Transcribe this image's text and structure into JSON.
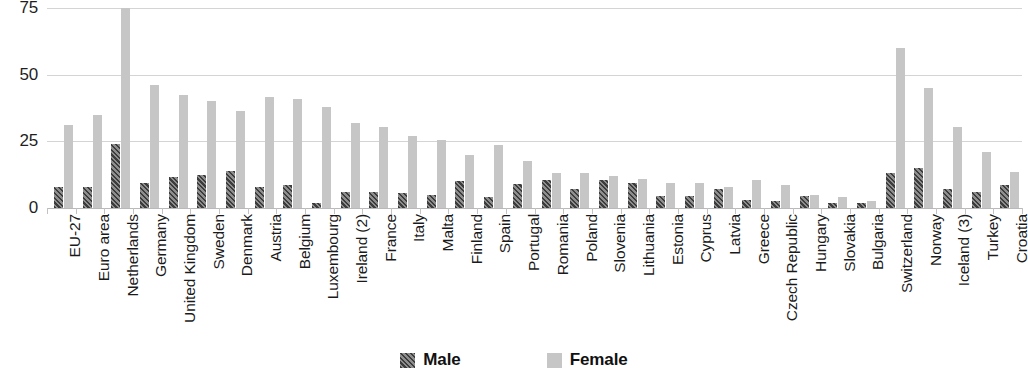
{
  "chart_data": {
    "type": "bar",
    "title": "",
    "subtitle": "",
    "xlabel": "",
    "ylabel": "",
    "ylim": [
      0,
      75
    ],
    "yticks": [
      0,
      25,
      50,
      75
    ],
    "ytick_labels": [
      "0",
      "25",
      "50",
      "75"
    ],
    "grid": true,
    "legend_position": "bottom-center",
    "categories": [
      "EU-27",
      "Euro area",
      "Netherlands",
      "Germany",
      "United Kingdom",
      "Sweden",
      "Denmark",
      "Austria",
      "Belgium",
      "Luxembourg",
      "Ireland (2)",
      "France",
      "Italy",
      "Malta",
      "Finland",
      "Spain",
      "Portugal",
      "Romania",
      "Poland",
      "Slovenia",
      "Lithuania",
      "Estonia",
      "Cyprus",
      "Latvia",
      "Greece",
      "Czech Republic",
      "Hungary",
      "Slovakia",
      "Bulgaria",
      "Switzerland",
      "Norway",
      "Iceland (3)",
      "Turkey",
      "Croatia"
    ],
    "series": [
      {
        "name": "Male",
        "color": "#6a6a6a",
        "pattern": "diagonal-hatch",
        "values": [
          8,
          8,
          24,
          9.5,
          11.5,
          12.5,
          14,
          8,
          8.5,
          2,
          6,
          6,
          5.5,
          5,
          10,
          4,
          9,
          10.5,
          7,
          10.5,
          9.5,
          4.5,
          4.5,
          7,
          3,
          2.5,
          4.5,
          2,
          2,
          13,
          15,
          7,
          6,
          8.5
        ]
      },
      {
        "name": "Female",
        "color": "#c6c6c6",
        "pattern": "solid",
        "values": [
          31,
          35,
          75,
          46,
          42.5,
          40,
          36.5,
          41.5,
          41,
          38,
          32,
          30.5,
          27,
          25.5,
          20,
          23.5,
          17.5,
          13,
          13,
          12,
          11,
          9.5,
          9.5,
          8,
          10.5,
          8.5,
          5,
          4,
          2.5,
          60,
          45,
          30.5,
          21,
          13.5
        ]
      }
    ]
  },
  "legend": {
    "items": [
      {
        "label": "Male",
        "swatch": "male-hatched-swatch"
      },
      {
        "label": "Female",
        "swatch": "female-solid-swatch"
      }
    ]
  },
  "colors": {
    "male": "#6a6a6a",
    "male_hatch_dark": "#3c3c3c",
    "female": "#c6c6c6",
    "gridline": "#d4d4d4",
    "axis": "#b9b9b9",
    "text": "#1a1a1a"
  }
}
